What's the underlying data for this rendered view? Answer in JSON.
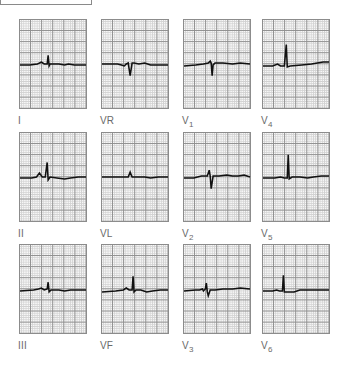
{
  "figure": {
    "type": "12-lead ECG",
    "grid": {
      "major_line_color": "#8f8f8f",
      "minor_line_color": "#d2d2d2",
      "trace_color": "#111111"
    },
    "layout": "3 rows x 4 columns"
  },
  "leads": [
    {
      "id": "I",
      "label": "I",
      "sub": "",
      "row": 0,
      "col": 0,
      "qrs": "small upright R"
    },
    {
      "id": "VR",
      "label": "VR",
      "sub": "",
      "row": 0,
      "col": 1,
      "qrs": "negative QS"
    },
    {
      "id": "V1",
      "label": "V",
      "sub": "1",
      "row": 0,
      "col": 2,
      "qrs": "small r, deep S"
    },
    {
      "id": "V4",
      "label": "V",
      "sub": "4",
      "row": 0,
      "col": 3,
      "qrs": "tall R"
    },
    {
      "id": "II",
      "label": "II",
      "sub": "",
      "row": 1,
      "col": 0,
      "qrs": "upright R"
    },
    {
      "id": "VL",
      "label": "VL",
      "sub": "",
      "row": 1,
      "col": 1,
      "qrs": "very small r"
    },
    {
      "id": "V2",
      "label": "V",
      "sub": "2",
      "row": 1,
      "col": 2,
      "qrs": "small r, deep S"
    },
    {
      "id": "V5",
      "label": "V",
      "sub": "5",
      "row": 1,
      "col": 3,
      "qrs": "tall R"
    },
    {
      "id": "III",
      "label": "III",
      "sub": "",
      "row": 2,
      "col": 0,
      "qrs": "small upright R"
    },
    {
      "id": "VF",
      "label": "VF",
      "sub": "",
      "row": 2,
      "col": 1,
      "qrs": "upright R"
    },
    {
      "id": "V3",
      "label": "V",
      "sub": "3",
      "row": 2,
      "col": 2,
      "qrs": "RS biphasic"
    },
    {
      "id": "V6",
      "label": "V",
      "sub": "6",
      "row": 2,
      "col": 3,
      "qrs": "upright R"
    }
  ]
}
